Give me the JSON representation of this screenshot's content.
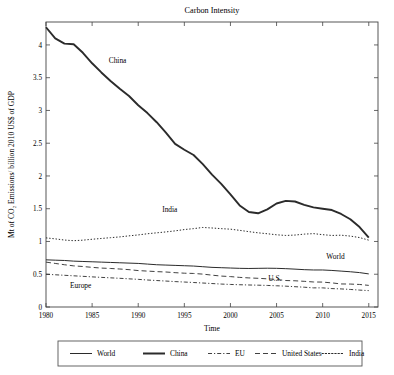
{
  "chart_data": {
    "type": "line",
    "title": "Carbon Intensity",
    "xlabel": "Time",
    "ylabel": "Mt of CO₂ Emissions/ billion 2010 US$ of GDP",
    "xlim": [
      1980,
      2016
    ],
    "ylim": [
      0,
      4.35
    ],
    "xticks": [
      1980,
      1985,
      1990,
      1995,
      2000,
      2005,
      2010,
      2015
    ],
    "yticks": [
      0,
      0.5,
      1,
      1.5,
      2,
      2.5,
      3,
      3.5,
      4
    ],
    "yticklabels": [
      "0",
      "0.5",
      "1",
      "1.5",
      "2",
      "2.5",
      "3",
      "3.5",
      "4"
    ],
    "grid": false,
    "legend_position": "below",
    "x": [
      1980,
      1981,
      1982,
      1983,
      1984,
      1985,
      1986,
      1987,
      1988,
      1989,
      1990,
      1991,
      1992,
      1993,
      1994,
      1995,
      1996,
      1997,
      1998,
      1999,
      2000,
      2001,
      2002,
      2003,
      2004,
      2005,
      2006,
      2007,
      2008,
      2009,
      2010,
      2011,
      2012,
      2013,
      2014,
      2015
    ],
    "series": [
      {
        "name": "World",
        "style": "solid-thin",
        "width": 1.0,
        "dash": "none",
        "values": [
          0.72,
          0.715,
          0.71,
          0.7,
          0.695,
          0.69,
          0.685,
          0.68,
          0.675,
          0.67,
          0.665,
          0.655,
          0.645,
          0.64,
          0.635,
          0.63,
          0.625,
          0.615,
          0.605,
          0.6,
          0.595,
          0.59,
          0.588,
          0.59,
          0.592,
          0.59,
          0.585,
          0.578,
          0.57,
          0.565,
          0.565,
          0.558,
          0.548,
          0.538,
          0.525,
          0.505
        ]
      },
      {
        "name": "China",
        "style": "solid-thick",
        "width": 1.9,
        "dash": "none",
        "values": [
          4.27,
          4.1,
          4.02,
          4.01,
          3.88,
          3.72,
          3.58,
          3.45,
          3.33,
          3.22,
          3.08,
          2.96,
          2.82,
          2.66,
          2.49,
          2.4,
          2.32,
          2.18,
          2.02,
          1.88,
          1.72,
          1.55,
          1.45,
          1.43,
          1.49,
          1.58,
          1.62,
          1.61,
          1.56,
          1.52,
          1.5,
          1.48,
          1.42,
          1.34,
          1.22,
          1.06
        ]
      },
      {
        "name": "EU",
        "style": "dash-dot",
        "width": 0.9,
        "dash": "4,2,1.2,2",
        "values": [
          0.5,
          0.492,
          0.484,
          0.476,
          0.468,
          0.46,
          0.452,
          0.445,
          0.438,
          0.43,
          0.422,
          0.412,
          0.404,
          0.396,
          0.388,
          0.381,
          0.374,
          0.366,
          0.358,
          0.35,
          0.344,
          0.34,
          0.336,
          0.333,
          0.329,
          0.324,
          0.318,
          0.31,
          0.302,
          0.292,
          0.292,
          0.281,
          0.276,
          0.268,
          0.258,
          0.25
        ]
      },
      {
        "name": "United States",
        "style": "dashed",
        "width": 0.9,
        "dash": "5,3",
        "values": [
          0.685,
          0.665,
          0.645,
          0.628,
          0.618,
          0.605,
          0.594,
          0.588,
          0.58,
          0.57,
          0.556,
          0.548,
          0.54,
          0.534,
          0.524,
          0.516,
          0.512,
          0.502,
          0.486,
          0.472,
          0.464,
          0.452,
          0.444,
          0.438,
          0.43,
          0.42,
          0.404,
          0.4,
          0.392,
          0.382,
          0.38,
          0.368,
          0.352,
          0.35,
          0.344,
          0.33
        ]
      },
      {
        "name": "India",
        "style": "dotted",
        "width": 1.0,
        "dash": "1.4,1.8",
        "values": [
          1.055,
          1.04,
          1.022,
          1.012,
          1.02,
          1.034,
          1.046,
          1.058,
          1.07,
          1.086,
          1.1,
          1.118,
          1.132,
          1.146,
          1.162,
          1.182,
          1.196,
          1.214,
          1.206,
          1.196,
          1.188,
          1.17,
          1.15,
          1.132,
          1.118,
          1.102,
          1.092,
          1.098,
          1.112,
          1.12,
          1.104,
          1.092,
          1.096,
          1.082,
          1.06,
          1.02
        ]
      }
    ],
    "inline_labels": [
      {
        "text": "China",
        "x": 1986.8,
        "y": 3.72
      },
      {
        "text": "India",
        "x": 1992.6,
        "y": 1.45
      },
      {
        "text": "World",
        "x": 2010.4,
        "y": 0.735
      },
      {
        "text": "Europe",
        "x": 1982.6,
        "y": 0.285
      },
      {
        "text": "U.S.",
        "x": 2004.1,
        "y": 0.395
      }
    ],
    "legend": [
      {
        "label": "World",
        "style": "solid-thin",
        "dash": "none",
        "width": 1.0
      },
      {
        "label": "China",
        "style": "solid-thick",
        "dash": "none",
        "width": 2.0
      },
      {
        "label": "EU",
        "style": "dash-dot",
        "dash": "4,2,1.2,2",
        "width": 0.9
      },
      {
        "label": "United States",
        "style": "dashed",
        "dash": "5,3",
        "width": 0.9
      },
      {
        "label": "India",
        "style": "dotted",
        "dash": "1.4,1.8",
        "width": 1.0
      }
    ],
    "colors": {
      "line": "#2b2b2b",
      "frame": "#444444",
      "legend_border": "#555555",
      "background": "#ffffff"
    }
  }
}
